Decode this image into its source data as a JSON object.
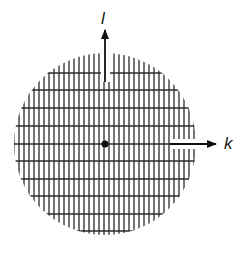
{
  "diagram": {
    "type": "hatched-disc-with-axes",
    "colors": {
      "line": "#2b2b2b",
      "background": "#ffffff",
      "center_dot": "#111111"
    },
    "disc": {
      "cx": 105,
      "cy": 144,
      "r": 91
    },
    "hatching": {
      "vertical_spacing": 5,
      "horizontal_lines_y": [
        73,
        90,
        108,
        126,
        144,
        161,
        179,
        196,
        214,
        231
      ]
    },
    "axes": [
      {
        "name": "l",
        "label": "l",
        "direction": "up",
        "from": [
          105,
          82
        ],
        "to": [
          105,
          30
        ]
      },
      {
        "name": "k",
        "label": "k",
        "direction": "right",
        "from": [
          170,
          144
        ],
        "to": [
          216,
          144
        ]
      }
    ],
    "center_point": {
      "x": 105,
      "y": 144,
      "r": 3.5
    }
  }
}
